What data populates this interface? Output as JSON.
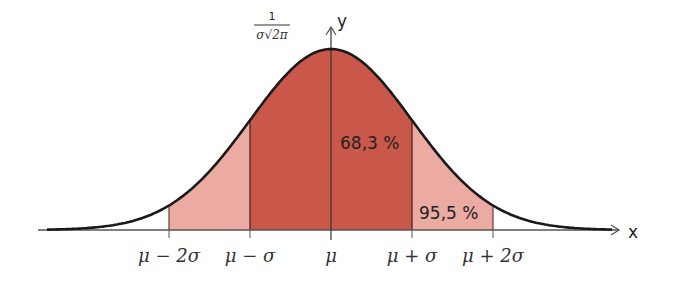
{
  "axes": {
    "x_label": "x",
    "y_label": "y"
  },
  "peak_label": {
    "numerator": "1",
    "denominator": "σ√2π"
  },
  "ticks": [
    {
      "key": "m2s",
      "label": "μ − 2σ"
    },
    {
      "key": "m1s",
      "label": "μ − σ"
    },
    {
      "key": "mu",
      "label": "μ"
    },
    {
      "key": "p1s",
      "label": "μ + σ"
    },
    {
      "key": "p2s",
      "label": "μ + 2σ"
    }
  ],
  "regions": {
    "inner": {
      "label": "68,3 %",
      "range": "μ ± σ",
      "color": "#c9574a"
    },
    "outer": {
      "label": "95,5 %",
      "range": "μ ± 2σ",
      "color": "#ebaaa2"
    }
  },
  "colors": {
    "curve": "#1a1a1a",
    "axis": "#555555",
    "divider": "#4a1a14"
  },
  "chart_data": {
    "type": "area",
    "xlabel": "x",
    "ylabel": "y",
    "peak_value": "1/(σ√(2π))",
    "x_ticks": [
      "μ − 2σ",
      "μ − σ",
      "μ",
      "μ + σ",
      "μ + 2σ"
    ],
    "shaded_intervals": [
      {
        "from": "μ − σ",
        "to": "μ + σ",
        "percent": 68.3
      },
      {
        "from": "μ − 2σ",
        "to": "μ + 2σ",
        "percent": 95.5
      }
    ]
  }
}
